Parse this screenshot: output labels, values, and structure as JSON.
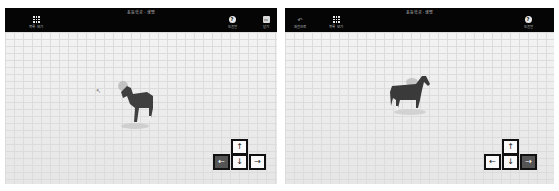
{
  "panels": [
    {
      "title": "초등학교 · 생명",
      "buttons": {
        "list": {
          "label": "목록 보기",
          "icon": "grid-icon"
        },
        "help": {
          "label": "도움말",
          "icon": "help-icon",
          "glyph": "?"
        },
        "close": {
          "label": "닫기",
          "icon": "close-icon",
          "glyph": "▭"
        }
      },
      "model": "horse",
      "keys": {
        "up": "↑",
        "left": "←",
        "down": "↓",
        "right": "→",
        "active": "left"
      }
    },
    {
      "title": "초등학교 · 생명",
      "buttons": {
        "back": {
          "label": "처음으로",
          "icon": "back-icon",
          "glyph": "↶"
        },
        "list": {
          "label": "목록 보기",
          "icon": "grid-icon"
        },
        "help": {
          "label": "도움말",
          "icon": "help-icon",
          "glyph": "?"
        }
      },
      "model": "horse",
      "keys": {
        "up": "↑",
        "left": "←",
        "down": "↓",
        "right": "→",
        "active": "right"
      }
    }
  ],
  "colors": {
    "header": "#050505",
    "floor": "#ececec",
    "key_active": "#555555"
  }
}
